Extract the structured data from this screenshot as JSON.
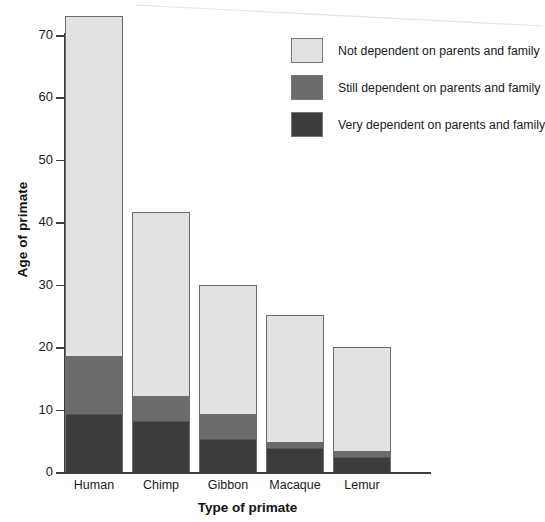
{
  "chart_data": {
    "type": "bar",
    "subtype": "stacked-vertical",
    "title": "",
    "xlabel": "Type of primate",
    "ylabel": "Age of primate",
    "categories": [
      "Human",
      "Chimp",
      "Gibbon",
      "Macaque",
      "Lemur"
    ],
    "ylim": [
      0,
      73
    ],
    "yticks": [
      0,
      10,
      20,
      30,
      40,
      50,
      60,
      70
    ],
    "ytick_labels": [
      "0",
      "10",
      "20",
      "30",
      "40",
      "50",
      "60",
      "70"
    ],
    "grid": false,
    "legend_position": "top-right",
    "series": [
      {
        "name": "Very dependent on parents and family",
        "color": "#3c3c3c",
        "values": [
          9.5,
          8.3,
          5.4,
          4.0,
          2.5
        ]
      },
      {
        "name": "Still dependent on parents and family",
        "color": "#6b6b6b",
        "values": [
          9.2,
          4.0,
          4.0,
          1.0,
          1.1
        ]
      },
      {
        "name": "Not dependent on parents and family",
        "color": "#e2e2e2",
        "values": [
          54.3,
          29.4,
          20.6,
          20.2,
          16.4
        ]
      }
    ],
    "totals": [
      73.0,
      41.7,
      30.0,
      25.2,
      20.0
    ],
    "segment_tops": {
      "very_dependent": [
        9.5,
        8.3,
        5.4,
        4.0,
        2.5
      ],
      "still_dependent": [
        18.7,
        12.3,
        9.4,
        5.0,
        3.6
      ],
      "not_dependent": [
        73.0,
        41.7,
        30.0,
        25.2,
        20.0
      ]
    }
  },
  "legend": {
    "items": [
      {
        "label": "Not dependent on parents and family",
        "color": "#e2e2e2"
      },
      {
        "label": "Still dependent on parents and family",
        "color": "#6b6b6b"
      },
      {
        "label": "Very dependent on parents and family",
        "color": "#3c3c3c"
      }
    ]
  },
  "axes": {
    "y_title": "Age of primate",
    "x_title": "Type of primate"
  },
  "colors": {
    "not_dependent": "#e2e2e2",
    "still_dependent": "#6b6b6b",
    "very_dependent": "#3c3c3c",
    "axis": "#3c3c3c",
    "bar_outline": "#6d6d6d",
    "background": "#ffffff"
  }
}
